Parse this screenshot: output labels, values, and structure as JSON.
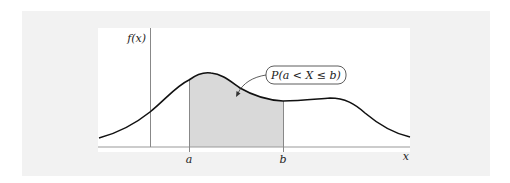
{
  "diagram": {
    "type": "probability-density-plot",
    "y_axis_label": "f(x)",
    "x_axis_label": "x",
    "lower_bound_label": "a",
    "upper_bound_label": "b",
    "annotation": "P(a < X ≤ b)",
    "shaded_region": "area under f(x) between a and b",
    "colors": {
      "background": "#f2f2f2",
      "panel": "#ffffff",
      "curve": "#111111",
      "shade": "#d9d9d9",
      "axis": "#888888"
    }
  }
}
